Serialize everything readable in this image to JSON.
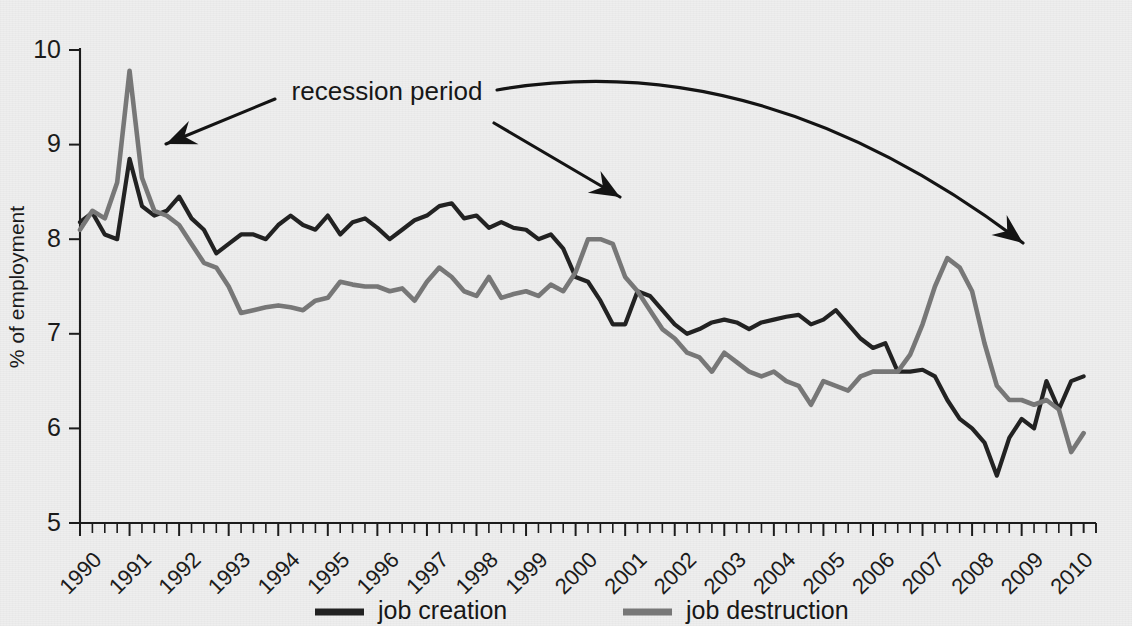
{
  "chart_data": {
    "type": "line",
    "title": "",
    "xlabel": "",
    "ylabel": "% of employment",
    "xlim": [
      1990,
      2010.5
    ],
    "ylim": [
      5,
      10
    ],
    "yticks": [
      5,
      6,
      7,
      8,
      9,
      10
    ],
    "ytick_labels": [
      "5",
      "6",
      "7",
      "8",
      "9",
      "10"
    ],
    "xticks": [
      1990,
      1991,
      1992,
      1993,
      1994,
      1995,
      1996,
      1997,
      1998,
      1999,
      2000,
      2001,
      2002,
      2003,
      2004,
      2005,
      2006,
      2007,
      2008,
      2009,
      2010
    ],
    "xtick_labels": [
      "1990",
      "1991",
      "1992",
      "1993",
      "1994",
      "1995",
      "1996",
      "1997",
      "1998",
      "1999",
      "2000",
      "2001",
      "2002",
      "2003",
      "2004",
      "2005",
      "2006",
      "2007",
      "2008",
      "2009",
      "2010"
    ],
    "minor_ticks_per_year": 4,
    "grid": false,
    "legend_position": "bottom",
    "series": [
      {
        "name": "job creation",
        "color": "#222222",
        "x": [
          1990.0,
          1990.25,
          1990.5,
          1990.75,
          1991.0,
          1991.25,
          1991.5,
          1991.75,
          1992.0,
          1992.25,
          1992.5,
          1992.75,
          1993.0,
          1993.25,
          1993.5,
          1993.75,
          1994.0,
          1994.25,
          1994.5,
          1994.75,
          1995.0,
          1995.25,
          1995.5,
          1995.75,
          1996.0,
          1996.25,
          1996.5,
          1996.75,
          1997.0,
          1997.25,
          1997.5,
          1997.75,
          1998.0,
          1998.25,
          1998.5,
          1998.75,
          1999.0,
          1999.25,
          1999.5,
          1999.75,
          2000.0,
          2000.25,
          2000.5,
          2000.75,
          2001.0,
          2001.25,
          2001.5,
          2001.75,
          2002.0,
          2002.25,
          2002.5,
          2002.75,
          2003.0,
          2003.25,
          2003.5,
          2003.75,
          2004.0,
          2004.25,
          2004.5,
          2004.75,
          2005.0,
          2005.25,
          2005.5,
          2005.75,
          2006.0,
          2006.25,
          2006.5,
          2006.75,
          2007.0,
          2007.25,
          2007.5,
          2007.75,
          2008.0,
          2008.25,
          2008.5,
          2008.75,
          2009.0,
          2009.25,
          2009.5,
          2009.75,
          2010.0,
          2010.25
        ],
        "values": [
          8.18,
          8.28,
          8.05,
          8.0,
          8.85,
          8.35,
          8.25,
          8.3,
          8.45,
          8.22,
          8.1,
          7.85,
          7.95,
          8.05,
          8.05,
          8.0,
          8.15,
          8.25,
          8.15,
          8.1,
          8.25,
          8.05,
          8.18,
          8.22,
          8.12,
          8.0,
          8.1,
          8.2,
          8.25,
          8.35,
          8.38,
          8.22,
          8.25,
          8.12,
          8.18,
          8.12,
          8.1,
          8.0,
          8.05,
          7.9,
          7.6,
          7.55,
          7.35,
          7.1,
          7.1,
          7.45,
          7.4,
          7.25,
          7.1,
          7.0,
          7.05,
          7.12,
          7.15,
          7.12,
          7.05,
          7.12,
          7.15,
          7.18,
          7.2,
          7.1,
          7.15,
          7.25,
          7.1,
          6.95,
          6.85,
          6.9,
          6.6,
          6.6,
          6.62,
          6.55,
          6.3,
          6.1,
          6.0,
          5.85,
          5.5,
          5.9,
          6.1,
          6.0,
          6.5,
          6.2,
          6.5,
          6.55
        ]
      },
      {
        "name": "job destruction",
        "color": "#777777",
        "x": [
          1990.0,
          1990.25,
          1990.5,
          1990.75,
          1991.0,
          1991.25,
          1991.5,
          1991.75,
          1992.0,
          1992.25,
          1992.5,
          1992.75,
          1993.0,
          1993.25,
          1993.5,
          1993.75,
          1994.0,
          1994.25,
          1994.5,
          1994.75,
          1995.0,
          1995.25,
          1995.5,
          1995.75,
          1996.0,
          1996.25,
          1996.5,
          1996.75,
          1997.0,
          1997.25,
          1997.5,
          1997.75,
          1998.0,
          1998.25,
          1998.5,
          1998.75,
          1999.0,
          1999.25,
          1999.5,
          1999.75,
          2000.0,
          2000.25,
          2000.5,
          2000.75,
          2001.0,
          2001.25,
          2001.5,
          2001.75,
          2002.0,
          2002.25,
          2002.5,
          2002.75,
          2003.0,
          2003.25,
          2003.5,
          2003.75,
          2004.0,
          2004.25,
          2004.5,
          2004.75,
          2005.0,
          2005.25,
          2005.5,
          2005.75,
          2006.0,
          2006.25,
          2006.5,
          2006.75,
          2007.0,
          2007.25,
          2007.5,
          2007.75,
          2008.0,
          2008.25,
          2008.5,
          2008.75,
          2009.0,
          2009.25,
          2009.5,
          2009.75,
          2010.0,
          2010.25
        ],
        "values": [
          8.1,
          8.3,
          8.22,
          8.6,
          9.78,
          8.65,
          8.3,
          8.25,
          8.15,
          7.95,
          7.75,
          7.7,
          7.5,
          7.22,
          7.25,
          7.28,
          7.3,
          7.28,
          7.25,
          7.35,
          7.38,
          7.55,
          7.52,
          7.5,
          7.5,
          7.45,
          7.48,
          7.35,
          7.55,
          7.7,
          7.6,
          7.45,
          7.4,
          7.6,
          7.38,
          7.42,
          7.45,
          7.4,
          7.52,
          7.45,
          7.65,
          8.0,
          8.0,
          7.95,
          7.6,
          7.45,
          7.25,
          7.05,
          6.95,
          6.8,
          6.75,
          6.6,
          6.8,
          6.7,
          6.6,
          6.55,
          6.6,
          6.5,
          6.45,
          6.25,
          6.5,
          6.45,
          6.4,
          6.55,
          6.6,
          6.6,
          6.6,
          6.78,
          7.1,
          7.5,
          7.8,
          7.7,
          7.45,
          6.9,
          6.45,
          6.3,
          6.3,
          6.25,
          6.3,
          6.2,
          5.75,
          5.95
        ]
      }
    ],
    "annotations": [
      {
        "id": "recession-period-label",
        "text": "recession period",
        "x_px": 387,
        "y_px": 100
      },
      {
        "id": "arrow-1990-recession",
        "from_px": [
          275,
          99
        ],
        "to_px": [
          166,
          144
        ],
        "curved": false
      },
      {
        "id": "arrow-2001-recession",
        "from_px": [
          494,
          123
        ],
        "to_px": [
          620,
          197
        ],
        "curved": false
      },
      {
        "id": "arrow-2008-recession",
        "from_px": [
          497,
          90
        ],
        "to_px": [
          1023,
          243
        ],
        "curved": true
      }
    ]
  },
  "legend": {
    "items": [
      {
        "label": "job creation",
        "color": "#222222"
      },
      {
        "label": "job destruction",
        "color": "#777777"
      }
    ]
  },
  "geometry": {
    "plot_left_px": 80,
    "plot_right_px": 1096,
    "plot_top_px": 50,
    "plot_bottom_px": 523
  }
}
